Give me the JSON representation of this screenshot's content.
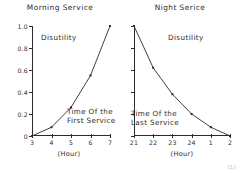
{
  "figure": {
    "marker": "(1)"
  },
  "panels": [
    {
      "id": "morning",
      "title": "Morning Service",
      "y_axis_name": "Disutility",
      "x_axis_name": "(Hour)",
      "series_note_line1": "Time Of the",
      "series_note_line2": "First Service"
    },
    {
      "id": "night",
      "title": "Night Serice",
      "y_axis_name": "Disutility",
      "x_axis_name": "(Hour)",
      "series_note_line1": "Time Of the",
      "series_note_line2": "Last Service"
    }
  ],
  "chart_data": [
    {
      "type": "line",
      "title": "Morning Service",
      "xlabel": "(Hour)",
      "ylabel": "Disutility",
      "x": [
        3,
        4,
        5,
        6,
        7
      ],
      "xtick_labels": [
        "3",
        "4",
        "5",
        "6",
        "7"
      ],
      "values": [
        0.0,
        0.08,
        0.26,
        0.55,
        1.0
      ],
      "ytick_labels": [
        "0",
        "0.2",
        "0.4",
        "0.6",
        "0.8",
        "1.0"
      ],
      "yticks": [
        0,
        0.2,
        0.4,
        0.6,
        0.8,
        1.0
      ],
      "xlim": [
        3,
        7
      ],
      "ylim": [
        0,
        1.0
      ],
      "grid": false,
      "legend": false,
      "markers": true,
      "annotation": "Time Of the First Service",
      "line_color": "#2b2b2b"
    },
    {
      "type": "line",
      "title": "Night Serice",
      "xlabel": "(Hour)",
      "ylabel": "Disutility",
      "x": [
        21,
        22,
        23,
        24,
        25,
        26
      ],
      "xtick_labels": [
        "21",
        "22",
        "23",
        "24",
        "1",
        "2"
      ],
      "values": [
        1.0,
        0.62,
        0.38,
        0.2,
        0.08,
        0.0
      ],
      "ytick_labels": [
        "",
        "",
        "",
        "",
        "",
        ""
      ],
      "yticks": [
        0,
        0.2,
        0.4,
        0.6,
        0.8,
        1.0
      ],
      "xlim": [
        21,
        26
      ],
      "ylim": [
        0,
        1.0
      ],
      "grid": false,
      "legend": false,
      "markers": true,
      "annotation": "Time Of the Last Service",
      "line_color": "#2b2b2b"
    }
  ]
}
